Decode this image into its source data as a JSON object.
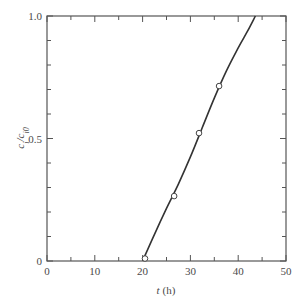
{
  "chart_data": {
    "type": "line",
    "title": "",
    "xlabel": "t (h)",
    "xlabel_var": "t",
    "xlabel_unit": "(h)",
    "ylabel": "c_i/c_i0",
    "xlim": [
      0,
      50
    ],
    "ylim": [
      0,
      1.0
    ],
    "xticks": [
      0,
      10,
      20,
      30,
      40,
      50
    ],
    "xtick_labels": [
      "0",
      "10",
      "20",
      "30",
      "40",
      "50"
    ],
    "yticks": [
      0,
      0.5,
      1.0
    ],
    "ytick_labels": [
      "0",
      "0.5",
      "1.0"
    ],
    "minor_x_step": 5,
    "minor_y_step": 0.1,
    "grid": false,
    "legend": null,
    "series": [
      {
        "name": "measured",
        "style": "open-circle markers",
        "x": [
          20.5,
          26.6,
          31.8,
          36.0
        ],
        "y": [
          0.01,
          0.265,
          0.522,
          0.714
        ]
      },
      {
        "name": "fitted curve",
        "style": "solid line",
        "x": [
          20.0,
          22.5,
          25.0,
          27.5,
          30.0,
          32.5,
          35.0,
          37.5,
          40.0,
          42.0,
          43.6
        ],
        "y": [
          0.0,
          0.11,
          0.215,
          0.315,
          0.425,
          0.545,
          0.665,
          0.775,
          0.87,
          0.94,
          1.0
        ]
      }
    ]
  },
  "colors": {
    "axis": "#555555",
    "line": "#333333",
    "marker_fill": "#ffffff",
    "marker_stroke": "#444444"
  }
}
